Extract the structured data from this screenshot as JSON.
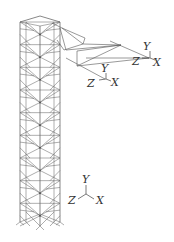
{
  "figure": {
    "colors": {
      "background": "#ffffff",
      "lines": "#6a6a6a",
      "text": "#333333"
    }
  },
  "tower": {
    "panels": 9,
    "left_x": 20,
    "right_x": 60,
    "mid_x": 40,
    "top_y": 18,
    "base_y": 222
  },
  "arm": {
    "label": "cantilever arm"
  },
  "axes": {
    "arm_tip": {
      "y": "Y",
      "z": "Z",
      "x": "X"
    },
    "arm_mid": {
      "y": "Y",
      "z": "Z",
      "x": "X"
    },
    "global": {
      "y": "Y",
      "z": "Z",
      "x": "X"
    }
  }
}
